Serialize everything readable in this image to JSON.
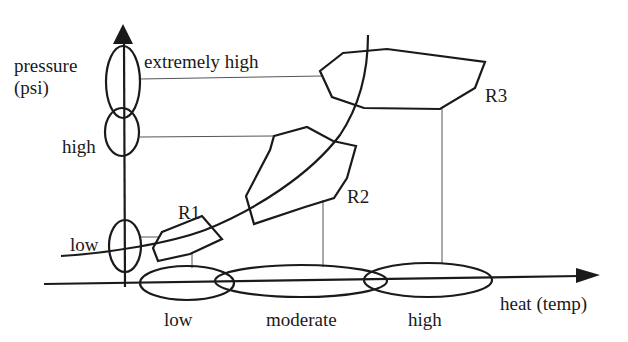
{
  "diagram": {
    "y_axis": {
      "label_line1": "pressure",
      "label_line2": "(psi)",
      "sets": [
        {
          "name": "extremely high",
          "label": "extremely high"
        },
        {
          "name": "high",
          "label": "high"
        },
        {
          "name": "low",
          "label": "low"
        }
      ]
    },
    "x_axis": {
      "label": "heat (temp)",
      "sets": [
        {
          "name": "low",
          "label": "low"
        },
        {
          "name": "moderate",
          "label": "moderate"
        },
        {
          "name": "high",
          "label": "high"
        }
      ]
    },
    "regions": [
      {
        "id": "R1",
        "label": "R1",
        "x_set": "low",
        "y_set": "low"
      },
      {
        "id": "R2",
        "label": "R2",
        "x_set": "moderate",
        "y_set": "high"
      },
      {
        "id": "R3",
        "label": "R3",
        "x_set": "high",
        "y_set": "extremely high"
      }
    ],
    "colors": {
      "stroke": "#1a1a1a",
      "guide": "#555555",
      "background": "#ffffff"
    }
  }
}
